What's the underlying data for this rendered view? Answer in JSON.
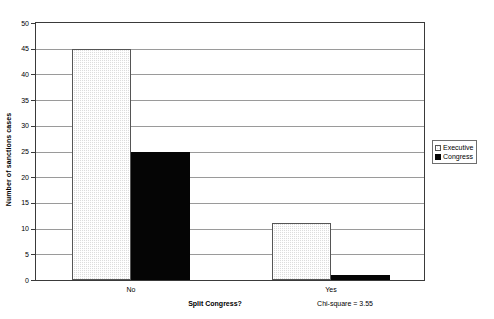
{
  "chart_data": {
    "type": "bar",
    "title": "",
    "subtitle": "",
    "xlabel": "Split Congress?",
    "ylabel": "Number of sanctions cases",
    "categories": [
      "No",
      "Yes"
    ],
    "series": [
      {
        "name": "Executive",
        "values": [
          45,
          11
        ],
        "color": "#dcdcdc",
        "pattern": "checkered"
      },
      {
        "name": "Congress",
        "values": [
          25,
          1
        ],
        "color": "#050505",
        "pattern": "solid"
      }
    ],
    "ylim": [
      0,
      50
    ],
    "ytick_step": 5,
    "yticks": [
      50,
      45,
      40,
      35,
      30,
      25,
      20,
      15,
      10,
      5,
      0
    ],
    "grid": {
      "horizontal": true,
      "vertical": false
    },
    "legend": {
      "position": "right",
      "entries": [
        "Executive",
        "Congress"
      ]
    },
    "annotations": [
      {
        "text": "Chi-square = 3.55",
        "position": "below-axis-right"
      }
    ]
  },
  "legend": {
    "items": [
      {
        "label": "Executive",
        "swatch": "checkered-swatch-icon"
      },
      {
        "label": "Congress",
        "swatch": "black-swatch-icon"
      }
    ]
  },
  "axes": {
    "y_title": "Number of sanctions cases",
    "x_title": "Split Congress?"
  },
  "annotation": {
    "chi_square": "Chi-square = 3.55"
  }
}
